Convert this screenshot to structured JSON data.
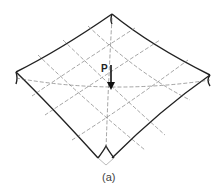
{
  "figure": {
    "caption": "(a)",
    "load_label": "P"
  },
  "colors": {
    "outline": "#222222",
    "grid": "#666666",
    "background": "#ffffff"
  }
}
